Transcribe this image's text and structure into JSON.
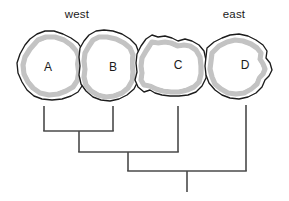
{
  "figure": {
    "background_color": "#ffffff",
    "width": 289,
    "height": 201
  },
  "compass": {
    "west_label": "west",
    "east_label": "east"
  },
  "areas": [
    {
      "id": "A",
      "label": "A",
      "position": "west-most",
      "label_x": 48,
      "label_y": 68
    },
    {
      "id": "B",
      "label": "B",
      "position": "west-central",
      "label_x": 113,
      "label_y": 68
    },
    {
      "id": "C",
      "label": "C",
      "position": "east-central",
      "label_x": 178,
      "label_y": 66
    },
    {
      "id": "D",
      "label": "D",
      "position": "east-most",
      "label_x": 245,
      "label_y": 66
    }
  ],
  "style_colors": {
    "outline": "#1c1c1c",
    "band": "#c3c3c3",
    "fill": "#ffffff",
    "tree_stroke": "#4a4a4a",
    "text": "#1a1a1a"
  },
  "cladogram": {
    "topology": "((A,B),C),D",
    "tip_order": [
      "A",
      "B",
      "C",
      "D"
    ],
    "tips": [
      {
        "taxon": "A",
        "x": 44,
        "y_top": 106,
        "y_bottom": 131
      },
      {
        "taxon": "B",
        "x": 113,
        "y_top": 106,
        "y_bottom": 131
      },
      {
        "taxon": "C",
        "x": 178,
        "y_top": 106,
        "y_bottom": 152
      },
      {
        "taxon": "D",
        "x": 246,
        "y_top": 105,
        "y_bottom": 171
      }
    ],
    "nodes": [
      {
        "name": "node-AB",
        "y": 131,
        "x_left": 44,
        "x_right": 113,
        "stem_x": 79,
        "stem_to_y": 152
      },
      {
        "name": "node-ABC",
        "y": 152,
        "x_left": 79,
        "x_right": 178,
        "stem_x": 128,
        "stem_to_y": 171
      },
      {
        "name": "node-ABCD-root",
        "y": 171,
        "x_left": 128,
        "x_right": 246,
        "stem_x": 187,
        "stem_to_y": 192
      }
    ]
  }
}
